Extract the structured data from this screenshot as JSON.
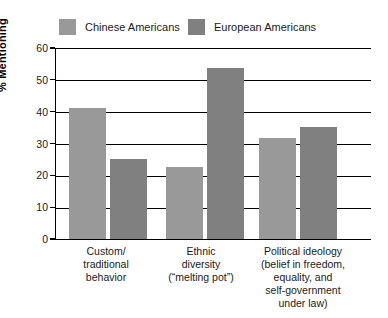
{
  "chart_data": {
    "type": "bar",
    "title": "",
    "xlabel": "",
    "ylabel": "% Mentioning",
    "ylim": [
      0,
      60
    ],
    "yticks": [
      0,
      10,
      20,
      30,
      40,
      50,
      60
    ],
    "ytick_labels": [
      "0",
      "10",
      "20",
      "30",
      "40",
      "50",
      "60"
    ],
    "grid": true,
    "legend_position": "top",
    "categories": [
      "Custom/\ntraditional\nbehavior",
      "Ethnic\ndiversity\n(“melting pot”)",
      "Political ideology\n(belief in freedom,\nequality, and\nself-government\nunder law)"
    ],
    "series": [
      {
        "name": "Chinese Americans",
        "color": "#999999",
        "values": [
          41.5,
          23.0,
          32.0
        ]
      },
      {
        "name": "European Americans",
        "color": "#808080",
        "values": [
          25.5,
          54.0,
          35.5
        ]
      }
    ]
  },
  "legend": {
    "items": [
      {
        "label": "Chinese Americans",
        "color": "#999999"
      },
      {
        "label": "European Americans",
        "color": "#808080"
      }
    ]
  },
  "axes": {
    "y_title": "% Mentioning",
    "y_ticks": [
      "60",
      "50",
      "40",
      "30",
      "20",
      "10",
      "0"
    ],
    "x_categories": [
      {
        "lines": [
          "Custom/",
          "traditional",
          "behavior"
        ]
      },
      {
        "lines": [
          "Ethnic",
          "diversity",
          "(“melting pot”)"
        ]
      },
      {
        "lines": [
          "Political ideology",
          "(belief in freedom,",
          "equality, and",
          "self-government",
          "under law)"
        ]
      }
    ]
  }
}
